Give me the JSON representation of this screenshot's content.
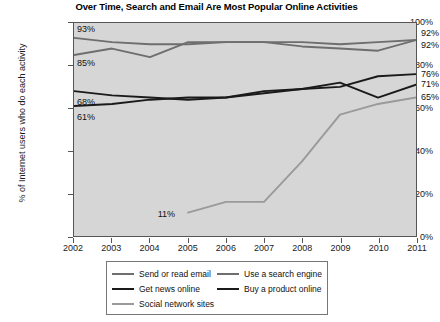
{
  "chart_data": {
    "type": "line",
    "title": "Over Time, Search and Email Are Most Popular Online Activities",
    "xlabel": "",
    "ylabel": "% of Internet users who do each activity",
    "categories": [
      "2002",
      "2003",
      "2004",
      "2005",
      "2006",
      "2007",
      "2008",
      "2009",
      "2010",
      "2011"
    ],
    "x": [
      2002,
      2003,
      2004,
      2005,
      2006,
      2007,
      2008,
      2009,
      2010,
      2011
    ],
    "ylim": [
      0,
      100
    ],
    "yticks": [
      "0%",
      "20%",
      "40%",
      "60%",
      "80%",
      "100%"
    ],
    "ytick_values": [
      0,
      20,
      40,
      60,
      80,
      100
    ],
    "grid": false,
    "legend_position": "bottom",
    "series": [
      {
        "name": "Send or read email",
        "color": "#6e6e6e",
        "values": [
          93,
          91,
          90,
          90,
          91,
          91,
          91,
          90,
          91,
          92
        ],
        "start_label": "93%",
        "end_label": "92%"
      },
      {
        "name": "Use a search engine",
        "color": "#6e6e6e",
        "values": [
          85,
          88,
          84,
          91,
          91,
          91,
          89,
          88,
          87,
          92
        ],
        "start_label": "85%",
        "end_label": "92%"
      },
      {
        "name": "Get news online",
        "color": "#1a1a1a",
        "values": [
          68,
          66,
          65,
          64,
          65,
          68,
          69,
          70,
          75,
          76
        ],
        "start_label": "68%",
        "end_label": "76%"
      },
      {
        "name": "Buy a product online",
        "color": "#1a1a1a",
        "values": [
          61,
          62,
          64,
          65,
          65,
          67,
          69,
          72,
          65,
          71
        ],
        "start_label": "61%",
        "end_label": "71%"
      },
      {
        "name": "Social network sites",
        "color": "#9a9a9a",
        "values": [
          null,
          null,
          null,
          11,
          16,
          16,
          35,
          57,
          62,
          65
        ],
        "start_label": "11%",
        "end_label": "65%"
      }
    ],
    "annotations": [
      {
        "text": "11%",
        "series": "Social network sites",
        "x": 2005,
        "y": 11
      }
    ]
  }
}
